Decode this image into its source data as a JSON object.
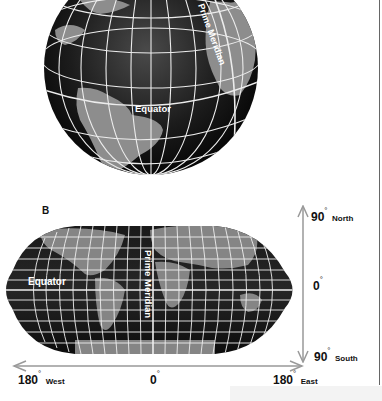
{
  "globe": {
    "equator_label": "Equator",
    "prime_meridian_label": "Prime Meridian"
  },
  "map": {
    "panel_label": "B",
    "equator_label": "Equator",
    "prime_meridian_label": "Prime Meridian"
  },
  "latitude_axis": {
    "north": {
      "value": "90",
      "deg": "°",
      "dir": "North"
    },
    "zero": {
      "value": "0",
      "deg": "°"
    },
    "south": {
      "value": "90",
      "deg": "°",
      "dir": "South"
    }
  },
  "longitude_axis": {
    "west": {
      "value": "180",
      "deg": "°",
      "dir": "West"
    },
    "zero": {
      "value": "0",
      "deg": "°"
    },
    "east": {
      "value": "180",
      "deg": "°",
      "dir": "East"
    }
  },
  "colors": {
    "ocean": "#141414",
    "land": "#8a8a8a",
    "grid": "#f0f0f0",
    "arrow": "#999999"
  }
}
